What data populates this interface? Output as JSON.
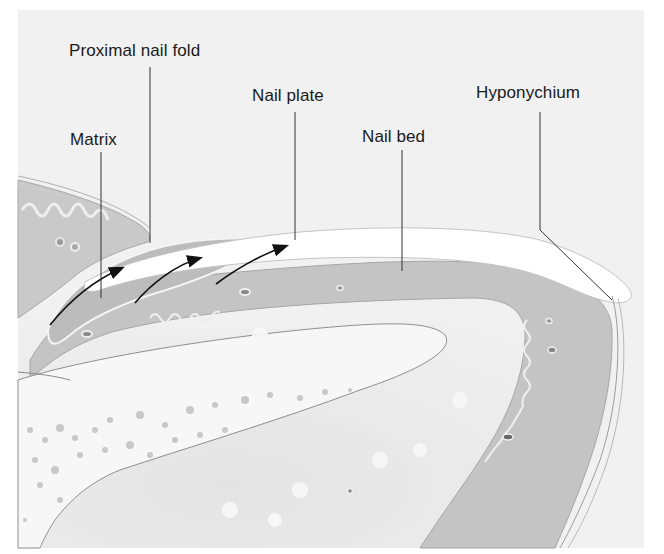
{
  "figure": {
    "labels": [
      {
        "id": "proximal-nail-fold",
        "text": "Proximal nail fold"
      },
      {
        "id": "nail-plate",
        "text": "Nail plate"
      },
      {
        "id": "matrix",
        "text": "Matrix"
      },
      {
        "id": "nail-bed",
        "text": "Nail bed"
      },
      {
        "id": "hyponychium",
        "text": "Hyponychium"
      }
    ],
    "colors": {
      "background": "#f1f1f1",
      "dermis_dark": "#bdbdbd",
      "dermis_mid": "#d8d8d8",
      "bone_light": "#f6f6f6",
      "nail_plate": "#ffffff",
      "outline": "#9a9a9a",
      "leader_line": "#333333",
      "arrow": "#111111"
    }
  }
}
